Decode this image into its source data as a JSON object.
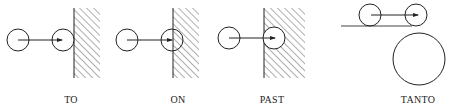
{
  "diagram": {
    "panels": [
      {
        "label": "TO",
        "label_x": 71
      },
      {
        "label": "ON",
        "label_x": 178
      },
      {
        "label": "PAST",
        "label_x": 272
      },
      {
        "label": "TANTO",
        "label_x": 418
      }
    ],
    "colors": {
      "stroke": "#222222",
      "background": "#ffffff"
    }
  }
}
